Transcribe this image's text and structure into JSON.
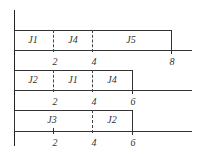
{
  "diagram": {
    "type": "gantt-schedule",
    "rows": [
      {
        "name": "machine-1",
        "end": 8,
        "jobs": [
          {
            "label": "J1",
            "start": 0,
            "end": 2
          },
          {
            "label": "J4",
            "start": 2,
            "end": 4
          },
          {
            "label": "J5",
            "start": 4,
            "end": 8
          }
        ],
        "ticks": [
          "2",
          "4",
          "8"
        ]
      },
      {
        "name": "machine-2",
        "end": 6,
        "jobs": [
          {
            "label": "J2",
            "start": 0,
            "end": 2
          },
          {
            "label": "J1",
            "start": 2,
            "end": 4
          },
          {
            "label": "J4",
            "start": 4,
            "end": 6
          }
        ],
        "ticks": [
          "2",
          "4",
          "6"
        ]
      },
      {
        "name": "machine-3",
        "end": 6,
        "jobs": [
          {
            "label": "J3",
            "start": 0,
            "end": 3
          },
          {
            "label": "J2",
            "start": 3,
            "end": 6
          }
        ],
        "ticks": [
          "2",
          "4",
          "6"
        ]
      }
    ]
  }
}
